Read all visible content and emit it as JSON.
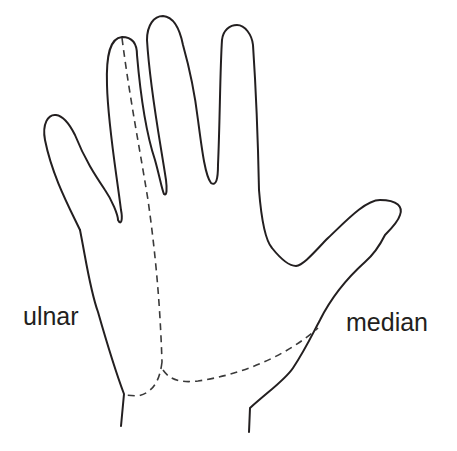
{
  "diagram": {
    "type": "hand-nerve-distribution",
    "labels": {
      "ulnar": "ulnar",
      "median": "median"
    },
    "colors": {
      "outline": "#231f20",
      "dashed_boundary": "#3a3a3a",
      "background": "#ffffff"
    },
    "line_styles": {
      "outline": "solid",
      "nerve_boundary": "dashed"
    }
  }
}
